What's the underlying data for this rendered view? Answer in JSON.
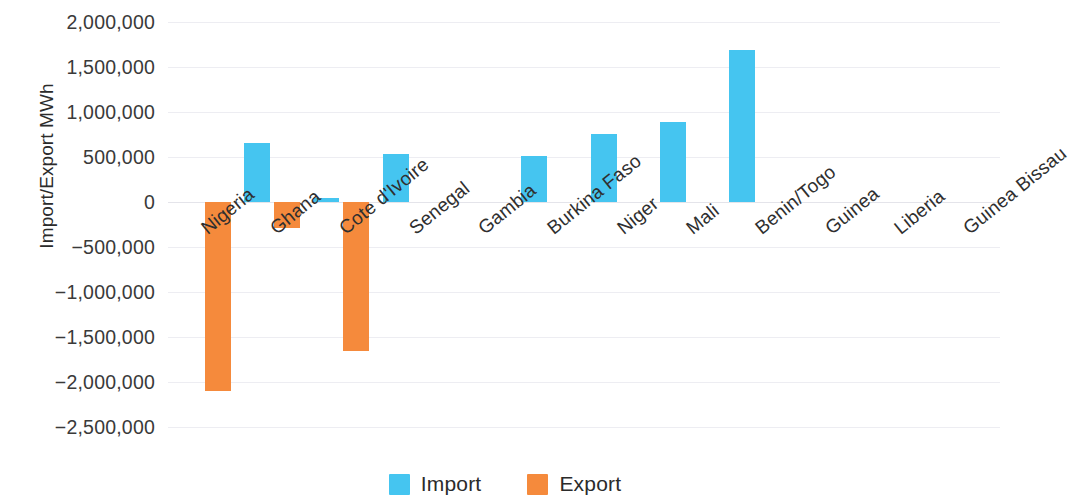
{
  "chart_data": {
    "type": "bar",
    "title": "",
    "xlabel": "",
    "ylabel": "Import/Export MWh",
    "categories": [
      "Nigeria",
      "Ghana",
      "Cote d'Ivoire",
      "Senegal",
      "Gambia",
      "Burkina Faso",
      "Niger",
      "Mali",
      "Benin/Togo",
      "Guinea",
      "Liberia",
      "Guinea Bissau"
    ],
    "series": [
      {
        "name": "Import",
        "color": "#45c5f0",
        "values": [
          0,
          655000,
          45000,
          535000,
          0,
          510000,
          755000,
          890000,
          1690000,
          0,
          0,
          0
        ]
      },
      {
        "name": "Export",
        "color": "#f58a3c",
        "values": [
          -2100000,
          -290000,
          -1655000,
          0,
          0,
          0,
          0,
          0,
          0,
          0,
          0,
          0
        ]
      }
    ],
    "ylim": [
      -2500000,
      2000000
    ],
    "yticks": [
      2000000,
      1500000,
      1000000,
      500000,
      0,
      -500000,
      -1000000,
      -1500000,
      -2000000,
      -2500000
    ],
    "ytick_labels": [
      "2,000,000",
      "1,500,000",
      "1,000,000",
      "500,000",
      "0",
      "−500,000",
      "−1,000,000",
      "−1,500,000",
      "−2,000,000",
      "−2,500,000"
    ],
    "grid": true,
    "legend_position": "bottom"
  },
  "legend": {
    "items": [
      {
        "label": "Import",
        "color": "#45c5f0"
      },
      {
        "label": "Export",
        "color": "#f58a3c"
      }
    ]
  }
}
